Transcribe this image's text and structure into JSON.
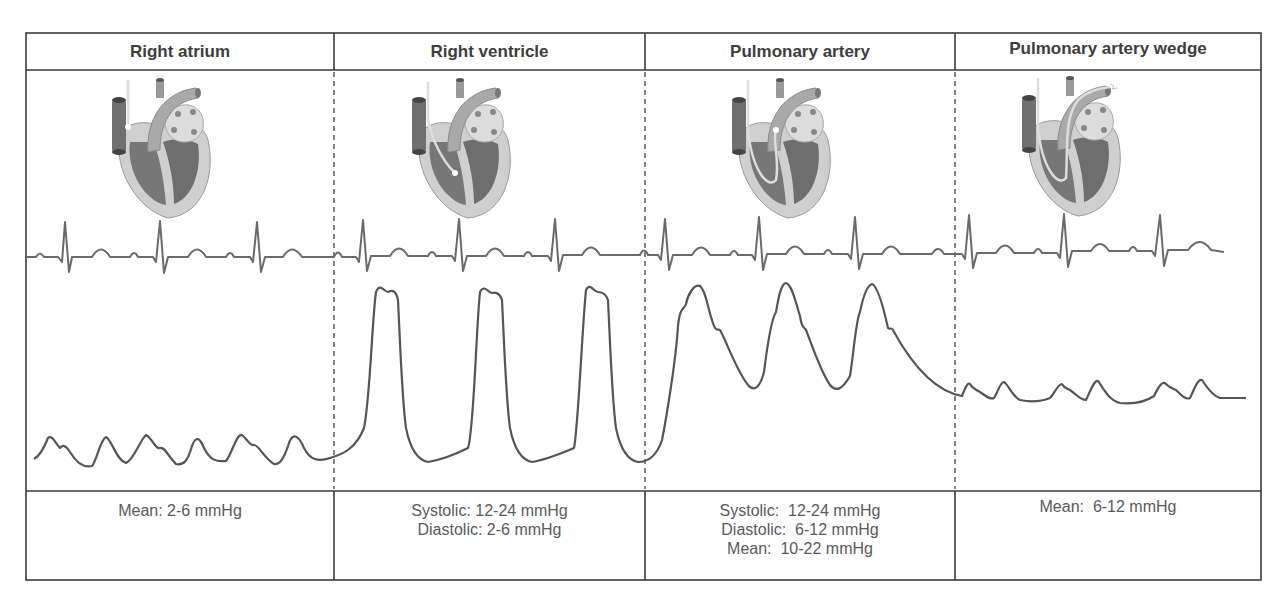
{
  "columns": [
    {
      "title": "Right atrium",
      "values": [
        "Mean: 2-6 mmHg"
      ],
      "catheter_position": "right-atrium"
    },
    {
      "title": "Right ventricle",
      "values": [
        "Systolic: 12-24 mmHg",
        "Diastolic: 2-6 mmHg"
      ],
      "catheter_position": "right-ventricle"
    },
    {
      "title": "Pulmonary artery",
      "values": [
        "Systolic:  12-24 mmHg",
        "Diastolic:  6-12 mmHg",
        "Mean:  10-22 mmHg"
      ],
      "catheter_position": "pulmonary-artery"
    },
    {
      "title": "Pulmonary artery wedge",
      "values": [
        "Mean:  6-12 mmHg"
      ],
      "catheter_position": "pulmonary-artery-wedge"
    }
  ],
  "colors": {
    "border": "#3a3a3a",
    "trace": "#555555",
    "ecg": "#6a6a6a",
    "heart_outer": "#c9c9c9",
    "heart_inner": "#7a7a7a",
    "vessel": "#a8a8a8",
    "atrium_dark": "#6f6f6f"
  }
}
